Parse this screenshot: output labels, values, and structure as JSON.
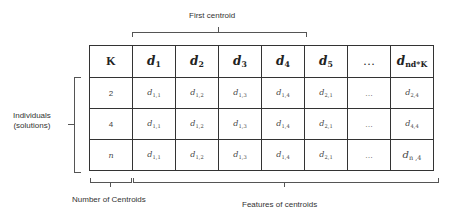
{
  "annotations": {
    "top": "First centroid",
    "left_line1": "Individuals",
    "left_line2": "(solutions)",
    "bottom_left": "Number of Centroids",
    "bottom_right": "Features of centroids"
  },
  "table": {
    "headers": [
      {
        "base": "K",
        "sub": ""
      },
      {
        "base": "d",
        "sub": "1"
      },
      {
        "base": "d",
        "sub": "2"
      },
      {
        "base": "d",
        "sub": "3"
      },
      {
        "base": "d",
        "sub": "4"
      },
      {
        "base": "d",
        "sub": "5"
      },
      {
        "base": "…",
        "sub": ""
      },
      {
        "base": "d",
        "sub": "nd*K"
      }
    ],
    "rows": [
      {
        "k": "2",
        "cells": [
          {
            "base": "d",
            "sub": "1,1"
          },
          {
            "base": "d",
            "sub": "1,2"
          },
          {
            "base": "d",
            "sub": "1,3"
          },
          {
            "base": "d",
            "sub": "1,4"
          },
          {
            "base": "d",
            "sub": "2,1"
          },
          {
            "base": "…",
            "sub": ""
          },
          {
            "base": "d",
            "sub": "2,4"
          }
        ]
      },
      {
        "k": "4",
        "cells": [
          {
            "base": "d",
            "sub": "1,1"
          },
          {
            "base": "d",
            "sub": "1,2"
          },
          {
            "base": "d",
            "sub": "1,3"
          },
          {
            "base": "d",
            "sub": "1,4"
          },
          {
            "base": "d",
            "sub": "2,1"
          },
          {
            "base": "…",
            "sub": ""
          },
          {
            "base": "d",
            "sub": "4,4"
          }
        ]
      },
      {
        "k": "n",
        "cells": [
          {
            "base": "d",
            "sub": "1,1"
          },
          {
            "base": "d",
            "sub": "1,2"
          },
          {
            "base": "d",
            "sub": "1,3"
          },
          {
            "base": "d",
            "sub": "1,4"
          },
          {
            "base": "d",
            "sub": "2,1"
          },
          {
            "base": "…",
            "sub": ""
          },
          {
            "base": "d",
            "sub": "n ,4"
          }
        ]
      }
    ]
  }
}
